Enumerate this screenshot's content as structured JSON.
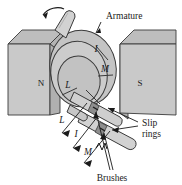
{
  "figure": {
    "type": "technical-line-diagram",
    "background_color": "#ffffff",
    "ink_color": "#1a1a1a"
  },
  "palette": {
    "magnet_front_face": "#c9c9c9",
    "magnet_top_face": "#bdbdbd",
    "magnet_side_face": "#b3b3b3",
    "armature_body": "#c4c4c4",
    "armature_face": "#cccccc",
    "armature_inner": "#bfbfbf",
    "shaft_light": "#d2d2d2",
    "shaft_shade": "#b0b0b0",
    "ring_band": "#8e8e8e",
    "outline": "#3a3a3a"
  },
  "labels": {
    "armature": "Armature",
    "slip_rings_line1": "Slip",
    "slip_rings_line2": "rings",
    "brushes": "Brushes",
    "pole_north": "N",
    "pole_south": "S",
    "coil_side_l_top": "L",
    "coil_side_m_top": "M",
    "current_i_top": "I",
    "coil_side_l_lead": "L",
    "coil_side_m_lead": "M",
    "current_i_lead": "I"
  },
  "annotations": [
    {
      "name": "rotation-arrow",
      "meaning": "direction of armature rotation",
      "shape": "curved-arrow",
      "position": "top-left of shaft"
    },
    {
      "name": "armature-leader",
      "meaning": "pointer line from Armature label to armature drum",
      "shape": "straight-leader-line"
    },
    {
      "name": "slip-rings-leader",
      "meaning": "two pointer lines from Slip rings label to the two rings",
      "shape": "double-leader-line"
    },
    {
      "name": "brushes-leader",
      "meaning": "two pointer lines from Brushes label to the two brush contacts",
      "shape": "double-leader-line"
    },
    {
      "name": "force-arrows",
      "meaning": "three labelled arrows L, I, M pointing down-left away from the armature",
      "shape": "arrow"
    }
  ]
}
